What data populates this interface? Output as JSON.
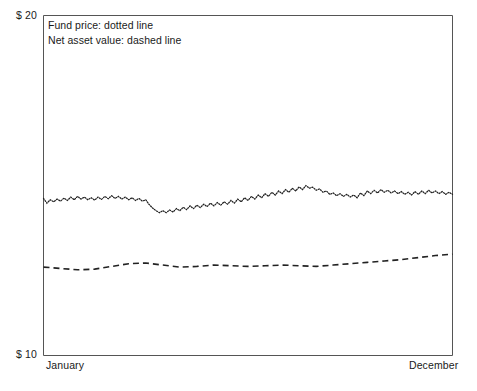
{
  "chart_data": {
    "type": "line",
    "title": "",
    "xlabel": "",
    "ylabel": "",
    "ylim": [
      10,
      20
    ],
    "xlim": [
      0,
      12
    ],
    "grid": false,
    "legend_position": "inside-top-left",
    "y_tick_labels": [
      "$ 10",
      "$ 20"
    ],
    "x_tick_labels": [
      "January",
      "December"
    ],
    "annotations": [
      "Fund price: dotted line",
      "Net asset value: dashed line"
    ],
    "series": [
      {
        "name": "Fund price",
        "style": "dotted",
        "color": "#222222",
        "x": [
          0,
          0.1,
          0.2,
          0.3,
          0.4,
          0.5,
          0.6,
          0.7,
          0.8,
          0.9,
          1,
          1.1,
          1.2,
          1.3,
          1.4,
          1.5,
          1.6,
          1.7,
          1.8,
          1.9,
          2,
          2.1,
          2.2,
          2.3,
          2.4,
          2.5,
          2.6,
          2.7,
          2.8,
          2.9,
          3,
          3.1,
          3.2,
          3.3,
          3.4,
          3.5,
          3.6,
          3.7,
          3.8,
          3.9,
          4,
          4.1,
          4.2,
          4.3,
          4.4,
          4.5,
          4.6,
          4.7,
          4.8,
          4.9,
          5,
          5.1,
          5.2,
          5.3,
          5.4,
          5.5,
          5.6,
          5.7,
          5.8,
          5.9,
          6,
          6.1,
          6.2,
          6.3,
          6.4,
          6.5,
          6.6,
          6.7,
          6.8,
          6.9,
          7,
          7.1,
          7.2,
          7.3,
          7.4,
          7.5,
          7.6,
          7.7,
          7.8,
          7.9,
          8,
          8.1,
          8.2,
          8.3,
          8.4,
          8.5,
          8.6,
          8.7,
          8.8,
          8.9,
          9,
          9.1,
          9.2,
          9.3,
          9.4,
          9.5,
          9.6,
          9.7,
          9.8,
          9.9,
          10,
          10.1,
          10.2,
          10.3,
          10.4,
          10.5,
          10.6,
          10.7,
          10.8,
          10.9,
          11,
          11.1,
          11.2,
          11.3,
          11.4,
          11.5,
          11.6,
          11.7,
          11.8,
          11.9,
          12
        ],
        "values": [
          14.62,
          14.48,
          14.58,
          14.52,
          14.6,
          14.54,
          14.63,
          14.56,
          14.66,
          14.58,
          14.68,
          14.6,
          14.66,
          14.58,
          14.64,
          14.57,
          14.66,
          14.59,
          14.68,
          14.61,
          14.7,
          14.62,
          14.68,
          14.6,
          14.66,
          14.58,
          14.64,
          14.56,
          14.62,
          14.54,
          14.58,
          14.44,
          14.34,
          14.26,
          14.2,
          14.26,
          14.2,
          14.28,
          14.22,
          14.32,
          14.26,
          14.36,
          14.29,
          14.4,
          14.32,
          14.42,
          14.35,
          14.45,
          14.38,
          14.48,
          14.4,
          14.5,
          14.42,
          14.52,
          14.45,
          14.56,
          14.48,
          14.6,
          14.52,
          14.64,
          14.56,
          14.68,
          14.6,
          14.72,
          14.64,
          14.76,
          14.68,
          14.8,
          14.72,
          14.84,
          14.76,
          14.88,
          14.8,
          14.92,
          14.84,
          14.96,
          14.88,
          15.0,
          14.92,
          14.95,
          14.86,
          14.9,
          14.8,
          14.84,
          14.74,
          14.78,
          14.7,
          14.76,
          14.68,
          14.74,
          14.66,
          14.72,
          14.64,
          14.78,
          14.7,
          14.84,
          14.76,
          14.86,
          14.78,
          14.88,
          14.8,
          14.86,
          14.78,
          14.84,
          14.76,
          14.82,
          14.74,
          14.8,
          14.72,
          14.82,
          14.74,
          14.84,
          14.76,
          14.86,
          14.78,
          14.84,
          14.76,
          14.82,
          14.74,
          14.8,
          14.74
        ]
      },
      {
        "name": "Net asset value",
        "style": "dashed",
        "color": "#222222",
        "x": [
          0,
          0.5,
          1,
          1.5,
          2,
          2.5,
          3,
          3.5,
          4,
          4.5,
          5,
          5.5,
          6,
          6.5,
          7,
          7.5,
          8,
          8.5,
          9,
          9.5,
          10,
          10.5,
          11,
          11.5,
          12
        ],
        "values": [
          12.6,
          12.56,
          12.52,
          12.54,
          12.62,
          12.7,
          12.72,
          12.66,
          12.6,
          12.62,
          12.66,
          12.64,
          12.62,
          12.64,
          12.66,
          12.64,
          12.62,
          12.66,
          12.7,
          12.74,
          12.78,
          12.82,
          12.88,
          12.94,
          12.98
        ]
      }
    ]
  },
  "axes": {
    "y_top_label": "$ 20",
    "y_bottom_label": "$ 10",
    "x_start_label": "January",
    "x_end_label": "December"
  },
  "legend": {
    "line1": "Fund price: dotted line",
    "line2": "Net asset value: dashed line"
  },
  "colors": {
    "background": "#ffffff",
    "axis": "#555555",
    "series": "#222222",
    "text": "#1a1a1a"
  }
}
